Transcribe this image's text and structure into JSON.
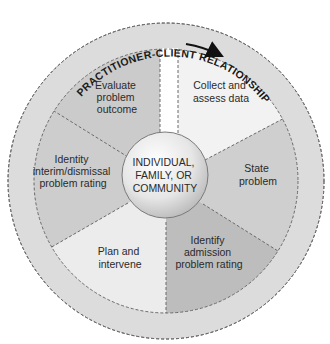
{
  "ring": {
    "label": "PRACTITIONER-CLIENT RELATIONSHIP",
    "direction": "clockwise"
  },
  "center": {
    "lines": [
      "INDIVIDUAL,",
      "FAMILY, OR",
      "COMMUNITY"
    ]
  },
  "segments": [
    {
      "id": "collect",
      "lines": [
        "Collect and",
        "assess data"
      ],
      "color": "#f2f2f2"
    },
    {
      "id": "state",
      "lines": [
        "State",
        "problem"
      ],
      "color": "#cfcfcf"
    },
    {
      "id": "identify-admission",
      "lines": [
        "Identify",
        "admission",
        "problem rating"
      ],
      "color": "#bdbdbd"
    },
    {
      "id": "plan",
      "lines": [
        "Plan and",
        "intervene"
      ],
      "color": "#ececec"
    },
    {
      "id": "identity-interim",
      "lines": [
        "Identity",
        "interim/dismissal",
        "problem rating"
      ],
      "color": "#cdcdcd"
    },
    {
      "id": "evaluate",
      "lines": [
        "Evaluate",
        "problem",
        "outcome"
      ],
      "color": "#cbcbcb"
    }
  ],
  "colors": {
    "outer_ring": "#dcdcdc",
    "dashed_border": "#6a6a6a",
    "center_circle": "#e8e8e8",
    "text": "#2a2a2a"
  }
}
